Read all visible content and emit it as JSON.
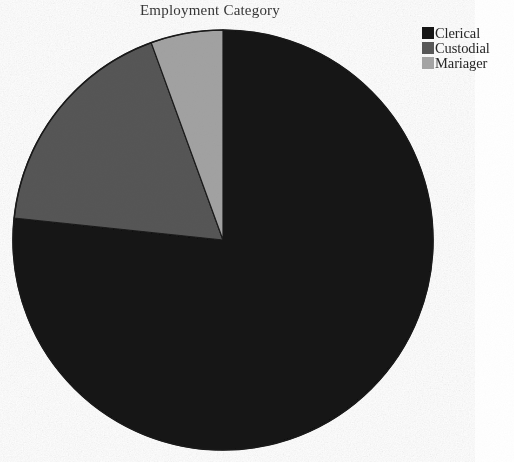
{
  "chart_data": {
    "type": "pie",
    "title": "Employment Category",
    "xlabel": "",
    "ylabel": "",
    "categories": [
      "Clerical",
      "Custodial",
      "Mariager"
    ],
    "values": [
      76.7,
      17.8,
      5.5
    ],
    "units": "percent",
    "legend_position": "top-right",
    "grid": false,
    "start_angle_deg": 0,
    "direction": "counterclockwise",
    "slices": [
      {
        "label": "Clerical",
        "value": 76.7,
        "color": "#121212",
        "start_angle_deg": 0,
        "end_angle_deg": 276.0,
        "sweep_deg": 276.0
      },
      {
        "label": "Custodial",
        "value": 17.8,
        "color": "#565656",
        "start_angle_deg": 276.0,
        "end_angle_deg": 340.0,
        "sweep_deg": 64.0
      },
      {
        "label": "Mariager",
        "value": 5.5,
        "color": "#a2a2a2",
        "start_angle_deg": 340.0,
        "end_angle_deg": 360.0,
        "sweep_deg": 20.0
      }
    ],
    "geometry": {
      "center_x": 223,
      "center_y": 240,
      "radius": 210
    }
  },
  "legend": {
    "items": [
      {
        "label": "Clerical",
        "color": "#151515",
        "swatch_name": "legend-swatch-clerical"
      },
      {
        "label": "Custodial",
        "color": "#585858",
        "swatch_name": "legend-swatch-custodial"
      },
      {
        "label": "Mariager",
        "color": "#a5a5a5",
        "swatch_name": "legend-swatch-mariager"
      }
    ]
  },
  "colors": {
    "background": "#ffffff",
    "outline": "#1a1a1a",
    "clerical": "#121212",
    "custodial": "#565656",
    "manager": "#a2a2a2",
    "title_text": "#2a2a2a",
    "legend_text": "#262626"
  }
}
